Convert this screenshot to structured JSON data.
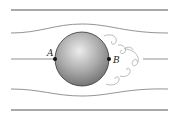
{
  "diagram": {
    "labels": {
      "point_a": "A",
      "point_b": "B"
    },
    "colors": {
      "wall": "#555555",
      "streamline": "#777777",
      "wake": "#aaaaaa",
      "sphere_light": "#e6e6e6",
      "sphere_dark": "#6e6e6e",
      "point": "#111111"
    }
  }
}
